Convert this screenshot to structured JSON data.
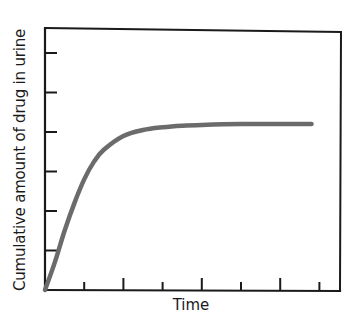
{
  "chart_data": {
    "type": "line",
    "title": "",
    "xlabel": "Time",
    "ylabel": "Cumulative amount of drug in urine",
    "x_ticks": 7,
    "y_ticks": 6,
    "tick_labels_shown": false,
    "grid": false,
    "legend": null,
    "xlim": [
      0,
      7.5
    ],
    "ylim": [
      0,
      6.6
    ],
    "series": [
      {
        "name": "Cumulative amount of drug in urine",
        "color": "#6b6b6b",
        "x": [
          0,
          0.25,
          0.5,
          0.75,
          1.0,
          1.25,
          1.5,
          2.0,
          2.5,
          3.0,
          3.5,
          4.0,
          5.0,
          6.0,
          6.8
        ],
        "y": [
          0,
          0.7,
          1.5,
          2.2,
          2.8,
          3.25,
          3.55,
          3.9,
          4.05,
          4.12,
          4.16,
          4.18,
          4.2,
          4.2,
          4.2
        ]
      }
    ],
    "annotations": []
  },
  "colors": {
    "axis": "#1a1a1a",
    "curve": "#6b6b6b",
    "background": "#ffffff"
  }
}
